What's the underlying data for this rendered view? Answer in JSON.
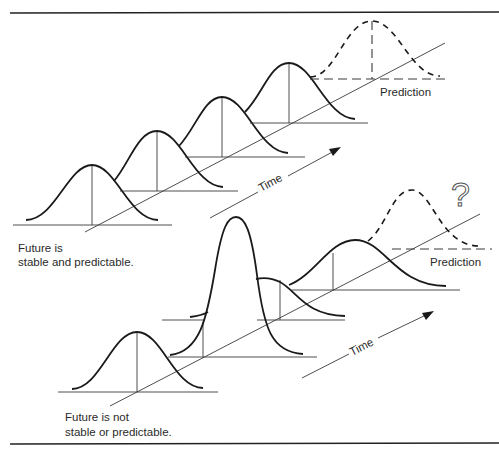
{
  "figure": {
    "top_panel": {
      "caption_line1": "Future is",
      "caption_line2": "stable and predictable.",
      "time_label": "Time",
      "prediction_label": "Prediction",
      "distributions": [
        {
          "id": "t1",
          "style": "solid",
          "shape": "normal"
        },
        {
          "id": "t2",
          "style": "solid",
          "shape": "normal"
        },
        {
          "id": "t3",
          "style": "solid",
          "shape": "normal"
        },
        {
          "id": "t4",
          "style": "solid",
          "shape": "normal"
        },
        {
          "id": "prediction",
          "style": "dashed",
          "shape": "normal"
        }
      ]
    },
    "bottom_panel": {
      "caption_line1": "Future is not",
      "caption_line2": "stable or predictable.",
      "time_label": "Time",
      "prediction_label": "Prediction",
      "question_mark": "?",
      "distributions": [
        {
          "id": "b1",
          "style": "solid",
          "shape": "normal"
        },
        {
          "id": "b2",
          "style": "solid",
          "shape": "tall-narrow"
        },
        {
          "id": "b3",
          "style": "solid",
          "shape": "short-wide"
        },
        {
          "id": "b4",
          "style": "solid",
          "shape": "wide"
        },
        {
          "id": "prediction",
          "style": "dashed",
          "shape": "uncertain"
        }
      ]
    },
    "colors": {
      "line": "#1a1a1a",
      "axis": "#3a3a3a",
      "text": "#2a2a2a",
      "background": "#ffffff"
    }
  }
}
